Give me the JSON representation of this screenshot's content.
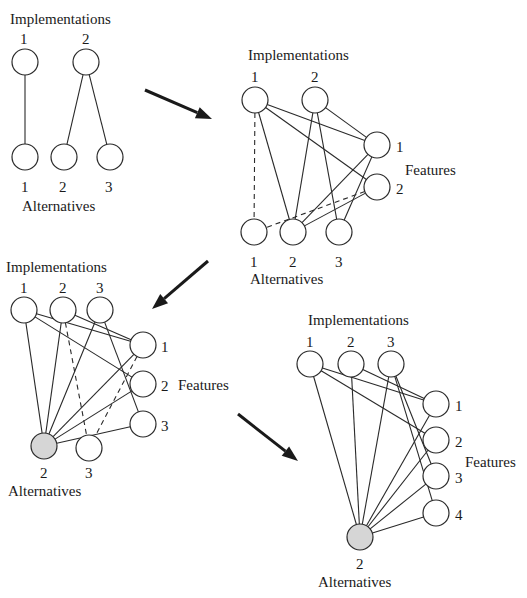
{
  "colors": {
    "node_fill": "#ffffff",
    "node_selected_fill": "#d6d6d6",
    "stroke": "#2a2a2a",
    "background": "#ffffff"
  },
  "panels": [
    {
      "id": "panel-1",
      "labels": {
        "implementations": {
          "text": "Implementations",
          "x": 10,
          "y": 24
        },
        "alternatives": {
          "text": "Alternatives",
          "x": 22,
          "y": 211
        },
        "features": null
      },
      "nodes": [
        {
          "id": "i1",
          "group": "implementation",
          "label": "1",
          "x": 25,
          "y": 62,
          "lx": 20,
          "ly": 44
        },
        {
          "id": "i2",
          "group": "implementation",
          "label": "2",
          "x": 86,
          "y": 62,
          "lx": 82,
          "ly": 44
        },
        {
          "id": "a1",
          "group": "alternative",
          "label": "1",
          "x": 25,
          "y": 157,
          "lx": 21,
          "ly": 192
        },
        {
          "id": "a2",
          "group": "alternative",
          "label": "2",
          "x": 64,
          "y": 157,
          "lx": 59,
          "ly": 192
        },
        {
          "id": "a3",
          "group": "alternative",
          "label": "3",
          "x": 110,
          "y": 157,
          "lx": 105,
          "ly": 192
        }
      ],
      "edges": [
        {
          "from": "i1",
          "to": "a1",
          "dashed": false
        },
        {
          "from": "i2",
          "to": "a2",
          "dashed": false
        },
        {
          "from": "i2",
          "to": "a3",
          "dashed": false
        }
      ]
    },
    {
      "id": "panel-2",
      "labels": {
        "implementations": {
          "text": "Implementations",
          "x": 248,
          "y": 60
        },
        "alternatives": {
          "text": "Alternatives",
          "x": 250,
          "y": 284
        },
        "features": {
          "text": "Features",
          "x": 405,
          "y": 175
        }
      },
      "nodes": [
        {
          "id": "i1",
          "group": "implementation",
          "label": "1",
          "x": 255,
          "y": 100,
          "lx": 251,
          "ly": 82
        },
        {
          "id": "i2",
          "group": "implementation",
          "label": "2",
          "x": 315,
          "y": 100,
          "lx": 311,
          "ly": 82
        },
        {
          "id": "f1",
          "group": "feature",
          "label": "1",
          "x": 377,
          "y": 145,
          "lx": 396,
          "ly": 152
        },
        {
          "id": "f2",
          "group": "feature",
          "label": "2",
          "x": 377,
          "y": 187,
          "lx": 396,
          "ly": 194
        },
        {
          "id": "a1",
          "group": "alternative",
          "label": "1",
          "x": 254,
          "y": 232,
          "lx": 250,
          "ly": 267
        },
        {
          "id": "a2",
          "group": "alternative",
          "label": "2",
          "x": 293,
          "y": 232,
          "lx": 289,
          "ly": 267
        },
        {
          "id": "a3",
          "group": "alternative",
          "label": "3",
          "x": 339,
          "y": 232,
          "lx": 335,
          "ly": 267
        }
      ],
      "edges": [
        {
          "from": "i1",
          "to": "a1",
          "dashed": true
        },
        {
          "from": "i1",
          "to": "a2",
          "dashed": false
        },
        {
          "from": "i1",
          "to": "f1",
          "dashed": false
        },
        {
          "from": "i1",
          "to": "f2",
          "dashed": false
        },
        {
          "from": "i2",
          "to": "a2",
          "dashed": false
        },
        {
          "from": "i2",
          "to": "a3",
          "dashed": false
        },
        {
          "from": "i2",
          "to": "f1",
          "dashed": false
        },
        {
          "from": "f1",
          "to": "a2",
          "dashed": false
        },
        {
          "from": "f1",
          "to": "a3",
          "dashed": false
        },
        {
          "from": "f2",
          "to": "a1",
          "dashed": true
        },
        {
          "from": "f2",
          "to": "a2",
          "dashed": false
        }
      ]
    },
    {
      "id": "panel-3",
      "labels": {
        "implementations": {
          "text": "Implementations",
          "x": 6,
          "y": 272
        },
        "alternatives": {
          "text": "Alternatives",
          "x": 8,
          "y": 496
        },
        "features": {
          "text": "Features",
          "x": 178,
          "y": 390
        }
      },
      "nodes": [
        {
          "id": "i1",
          "group": "implementation",
          "label": "1",
          "x": 24,
          "y": 310,
          "lx": 20,
          "ly": 293
        },
        {
          "id": "i2",
          "group": "implementation",
          "label": "2",
          "x": 63,
          "y": 310,
          "lx": 59,
          "ly": 293
        },
        {
          "id": "i3",
          "group": "implementation",
          "label": "3",
          "x": 100,
          "y": 310,
          "lx": 96,
          "ly": 293
        },
        {
          "id": "f1",
          "group": "feature",
          "label": "1",
          "x": 143,
          "y": 345,
          "lx": 161,
          "ly": 352
        },
        {
          "id": "f2",
          "group": "feature",
          "label": "2",
          "x": 143,
          "y": 384,
          "lx": 161,
          "ly": 391
        },
        {
          "id": "f3",
          "group": "feature",
          "label": "3",
          "x": 143,
          "y": 424,
          "lx": 161,
          "ly": 431
        },
        {
          "id": "a2",
          "group": "alternative",
          "label": "2",
          "x": 44,
          "y": 446,
          "lx": 40,
          "ly": 478,
          "selected": true
        },
        {
          "id": "a3",
          "group": "alternative",
          "label": "3",
          "x": 89,
          "y": 448,
          "lx": 85,
          "ly": 478
        }
      ],
      "edges": [
        {
          "from": "i1",
          "to": "a2",
          "dashed": false
        },
        {
          "from": "i1",
          "to": "f1",
          "dashed": false
        },
        {
          "from": "i1",
          "to": "f2",
          "dashed": false
        },
        {
          "from": "i2",
          "to": "a2",
          "dashed": false
        },
        {
          "from": "i2",
          "to": "a3",
          "dashed": true
        },
        {
          "from": "i2",
          "to": "f1",
          "dashed": false
        },
        {
          "from": "i3",
          "to": "a2",
          "dashed": false
        },
        {
          "from": "i3",
          "to": "f3",
          "dashed": false
        },
        {
          "from": "f1",
          "to": "a2",
          "dashed": false
        },
        {
          "from": "f1",
          "to": "a3",
          "dashed": true
        },
        {
          "from": "f2",
          "to": "a2",
          "dashed": false
        },
        {
          "from": "f3",
          "to": "a2",
          "dashed": false
        }
      ]
    },
    {
      "id": "panel-4",
      "labels": {
        "implementations": {
          "text": "Implementations",
          "x": 308,
          "y": 325
        },
        "alternatives": {
          "text": "Alternatives",
          "x": 318,
          "y": 587
        },
        "features": {
          "text": "Features",
          "x": 465,
          "y": 467
        }
      },
      "nodes": [
        {
          "id": "i1",
          "group": "implementation",
          "label": "1",
          "x": 310,
          "y": 364,
          "lx": 306,
          "ly": 347
        },
        {
          "id": "i2",
          "group": "implementation",
          "label": "2",
          "x": 351,
          "y": 364,
          "lx": 347,
          "ly": 347
        },
        {
          "id": "i3",
          "group": "implementation",
          "label": "3",
          "x": 391,
          "y": 364,
          "lx": 387,
          "ly": 347
        },
        {
          "id": "f1",
          "group": "feature",
          "label": "1",
          "x": 436,
          "y": 404,
          "lx": 455,
          "ly": 411
        },
        {
          "id": "f2",
          "group": "feature",
          "label": "2",
          "x": 436,
          "y": 440,
          "lx": 455,
          "ly": 447
        },
        {
          "id": "f3",
          "group": "feature",
          "label": "3",
          "x": 436,
          "y": 476,
          "lx": 455,
          "ly": 483
        },
        {
          "id": "f4",
          "group": "feature",
          "label": "4",
          "x": 436,
          "y": 513,
          "lx": 455,
          "ly": 520
        },
        {
          "id": "a2",
          "group": "alternative",
          "label": "2",
          "x": 360,
          "y": 537,
          "lx": 356,
          "ly": 569,
          "selected": true
        }
      ],
      "edges": [
        {
          "from": "i1",
          "to": "a2",
          "dashed": false
        },
        {
          "from": "i1",
          "to": "f1",
          "dashed": false
        },
        {
          "from": "i1",
          "to": "f2",
          "dashed": false
        },
        {
          "from": "i2",
          "to": "a2",
          "dashed": false
        },
        {
          "from": "i2",
          "to": "f1",
          "dashed": false
        },
        {
          "from": "i3",
          "to": "a2",
          "dashed": false
        },
        {
          "from": "i3",
          "to": "f3",
          "dashed": false
        },
        {
          "from": "i3",
          "to": "f4",
          "dashed": false
        },
        {
          "from": "f1",
          "to": "a2",
          "dashed": false
        },
        {
          "from": "f2",
          "to": "a2",
          "dashed": false
        },
        {
          "from": "f3",
          "to": "a2",
          "dashed": false
        },
        {
          "from": "f4",
          "to": "a2",
          "dashed": false
        }
      ]
    }
  ],
  "arrows": [
    {
      "id": "arrow-1-to-2",
      "x1": 145,
      "y1": 90,
      "x2": 212,
      "y2": 119
    },
    {
      "id": "arrow-2-to-3",
      "x1": 208,
      "y1": 261,
      "x2": 152,
      "y2": 309
    },
    {
      "id": "arrow-3-to-4",
      "x1": 238,
      "y1": 414,
      "x2": 298,
      "y2": 461
    }
  ],
  "node_radius": 13
}
